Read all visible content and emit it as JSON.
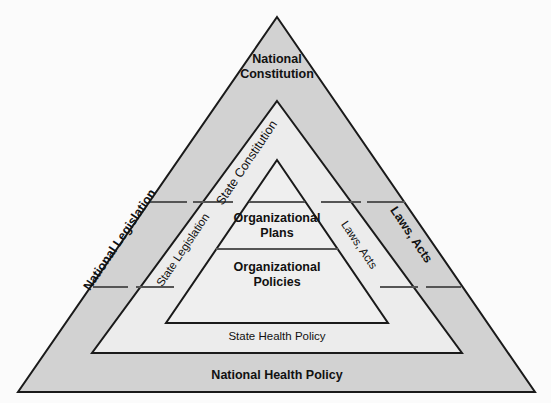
{
  "diagram": {
    "type": "nested-triangle-hierarchy",
    "colors": {
      "outer_band_fill": "#d2d2d2",
      "middle_band_fill": "#ececec",
      "inner_fill": "#efefef",
      "stroke": "#1a1a1a",
      "divider": "#555555",
      "background": "#fbfbfb",
      "text": "#111111"
    },
    "labels": {
      "apex": "National Constitution",
      "left_outer": "National Legislation",
      "left_inner": "State Legislation",
      "right_outer": "Laws, Acts",
      "right_inner": "Laws, Acts",
      "inner_apex": "State Constitution",
      "center_upper_line1": "Organizational",
      "center_upper_line2": "Plans",
      "center_lower_line1": "Organizational",
      "center_lower_line2": "Policies",
      "base_inner": "State Health Policy",
      "base_outer": "National Health Policy"
    },
    "levels": [
      {
        "name": "national-constitution",
        "label": "National Constitution",
        "emphasis": "bold"
      },
      {
        "name": "state-constitution",
        "label": "State Constitution",
        "emphasis": "regular"
      },
      {
        "name": "national-legislation",
        "label": "National Legislation",
        "emphasis": "bold"
      },
      {
        "name": "state-legislation",
        "label": "State Legislation",
        "emphasis": "regular"
      },
      {
        "name": "laws-acts-outer",
        "label": "Laws, Acts",
        "emphasis": "bold"
      },
      {
        "name": "laws-acts-inner",
        "label": "Laws, Acts",
        "emphasis": "regular"
      },
      {
        "name": "organizational-plans",
        "label": "Organizational Plans",
        "emphasis": "bold"
      },
      {
        "name": "organizational-policies",
        "label": "Organizational Policies",
        "emphasis": "bold"
      },
      {
        "name": "state-health-policy",
        "label": "State Health Policy",
        "emphasis": "regular"
      },
      {
        "name": "national-health-policy",
        "label": "National Health Policy",
        "emphasis": "bold"
      }
    ]
  }
}
